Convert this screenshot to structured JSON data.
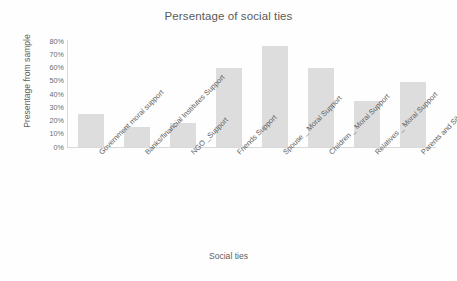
{
  "chart_data": {
    "type": "bar",
    "title": "Persentage of social ties",
    "xlabel": "Social ties",
    "ylabel": "Presentage from sample",
    "categories": [
      "Government moral support",
      "Banks/financial Institutes Support",
      "NGO _Support",
      "Friends Support",
      "Spouse _ Moral Support",
      "Children _ Moral Support",
      "Relatives _ Moral Support",
      "Parents and Siblings _ Moral…"
    ],
    "values": [
      25,
      15,
      18,
      60,
      76,
      60,
      35,
      49
    ],
    "ylim": [
      0,
      80
    ],
    "ytick_labels": [
      "80%",
      "70%",
      "60%",
      "50%",
      "40%",
      "30%",
      "20%",
      "10%",
      "0%"
    ],
    "ytick_values": [
      80,
      70,
      60,
      50,
      40,
      30,
      20,
      10,
      0
    ],
    "grid": false,
    "legend": false,
    "bar_color": "#dddddd",
    "axis_color": "#d9d9d9",
    "text_color": "#5e5e5e",
    "background": "#fefefe"
  }
}
